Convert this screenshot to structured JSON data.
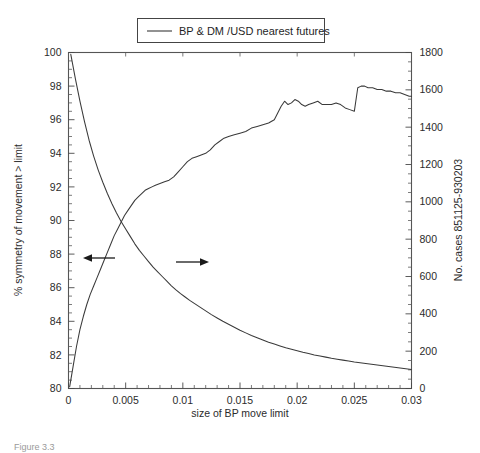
{
  "figure": {
    "caption_fragment": "Figure 3.3",
    "legend": {
      "label": "BP & DM /USD nearest futures",
      "swatch_name": "line-swatch"
    }
  },
  "chart_data": {
    "type": "line",
    "title": "",
    "subtitle": "",
    "xlabel": "size of BP move limit",
    "ylabel": "% symmetry of movement > limit",
    "y2label": "No. cases 851125-930203",
    "xlim": [
      0,
      0.03
    ],
    "ylim": [
      80,
      100
    ],
    "y2lim": [
      0,
      1800
    ],
    "grid": false,
    "legend_position": "top-center",
    "xticks": [
      0,
      0.005,
      0.01,
      0.015,
      0.02,
      0.025,
      0.03
    ],
    "xtick_labels": [
      "0",
      "0.005",
      "0.01",
      "0.015",
      "0.02",
      "0.025",
      "0.03"
    ],
    "yticks": [
      80,
      82,
      84,
      86,
      88,
      90,
      92,
      94,
      96,
      98,
      100
    ],
    "ytick_labels": [
      "80",
      "82",
      "84",
      "86",
      "88",
      "90",
      "92",
      "94",
      "96",
      "98",
      "100"
    ],
    "y2ticks": [
      0,
      200,
      400,
      600,
      800,
      1000,
      1200,
      1400,
      1600,
      1800
    ],
    "y2tick_labels": [
      "0",
      "200",
      "400",
      "600",
      "800",
      "1000",
      "1200",
      "1400",
      "1600",
      "1800"
    ],
    "annotations": [
      {
        "name": "left-arrow-to-left-axis",
        "text": "",
        "x": 0.0045,
        "y": 87.9,
        "direction": "left"
      },
      {
        "name": "right-arrow-to-right-axis",
        "text": "",
        "x": 0.0118,
        "y": 87.6,
        "direction": "right"
      }
    ],
    "series": [
      {
        "name": "% symmetry of movement > limit",
        "axis": "left",
        "unit": "percent",
        "x": [
          0.0001,
          0.0004,
          0.0007,
          0.001,
          0.0013,
          0.0016,
          0.0019,
          0.0022,
          0.0025,
          0.0028,
          0.0031,
          0.0034,
          0.0037,
          0.004,
          0.0043,
          0.0046,
          0.0049,
          0.0052,
          0.0055,
          0.0058,
          0.0061,
          0.0064,
          0.0067,
          0.007,
          0.0073,
          0.0076,
          0.008,
          0.0084,
          0.0088,
          0.0092,
          0.0096,
          0.01,
          0.0104,
          0.0108,
          0.0112,
          0.0116,
          0.012,
          0.0124,
          0.0128,
          0.0132,
          0.0136,
          0.014,
          0.0145,
          0.015,
          0.0155,
          0.016,
          0.0165,
          0.017,
          0.0175,
          0.018,
          0.0183,
          0.0186,
          0.0189,
          0.0192,
          0.0195,
          0.0198,
          0.0201,
          0.0204,
          0.0207,
          0.021,
          0.0214,
          0.0218,
          0.0222,
          0.0226,
          0.023,
          0.0234,
          0.0238,
          0.0242,
          0.0246,
          0.025,
          0.0253,
          0.0256,
          0.0259,
          0.0262,
          0.0266,
          0.027,
          0.0274,
          0.0278,
          0.0282,
          0.0286,
          0.029,
          0.0294,
          0.0298,
          0.03
        ],
        "y": [
          80.1,
          81.3,
          82.5,
          83.5,
          84.3,
          85.0,
          85.6,
          86.1,
          86.6,
          87.1,
          87.6,
          88.1,
          88.6,
          89.1,
          89.5,
          89.9,
          90.3,
          90.6,
          90.9,
          91.2,
          91.4,
          91.6,
          91.8,
          91.9,
          92.0,
          92.1,
          92.2,
          92.3,
          92.4,
          92.6,
          92.9,
          93.2,
          93.5,
          93.7,
          93.8,
          93.9,
          94.0,
          94.2,
          94.5,
          94.7,
          94.9,
          95.0,
          95.1,
          95.2,
          95.3,
          95.5,
          95.6,
          95.7,
          95.8,
          96.0,
          96.4,
          96.8,
          97.1,
          96.9,
          97.0,
          97.2,
          97.1,
          96.9,
          96.8,
          96.9,
          97.0,
          97.1,
          96.9,
          96.9,
          96.9,
          97.0,
          96.9,
          96.7,
          96.6,
          96.5,
          97.9,
          98.0,
          98.0,
          97.9,
          97.9,
          97.8,
          97.8,
          97.7,
          97.7,
          97.6,
          97.6,
          97.5,
          97.4,
          97.4
        ]
      },
      {
        "name": "No. cases 851125-930203",
        "axis": "right",
        "unit": "cases",
        "x": [
          0.0002,
          0.0006,
          0.001,
          0.0014,
          0.0018,
          0.0022,
          0.0026,
          0.003,
          0.0034,
          0.0038,
          0.0042,
          0.0046,
          0.005,
          0.0054,
          0.0058,
          0.0062,
          0.0066,
          0.007,
          0.0074,
          0.0078,
          0.0082,
          0.0086,
          0.009,
          0.0094,
          0.0098,
          0.0102,
          0.0106,
          0.011,
          0.0115,
          0.012,
          0.0125,
          0.013,
          0.0135,
          0.014,
          0.0145,
          0.015,
          0.0155,
          0.016,
          0.0165,
          0.017,
          0.0175,
          0.018,
          0.0185,
          0.019,
          0.0195,
          0.02,
          0.0205,
          0.021,
          0.0215,
          0.022,
          0.0225,
          0.023,
          0.0235,
          0.024,
          0.0245,
          0.025,
          0.0255,
          0.026,
          0.0265,
          0.027,
          0.0275,
          0.028,
          0.0285,
          0.029,
          0.0295,
          0.03
        ],
        "y": [
          1790,
          1660,
          1540,
          1430,
          1330,
          1245,
          1170,
          1105,
          1045,
          990,
          940,
          895,
          855,
          815,
          775,
          740,
          710,
          680,
          650,
          625,
          600,
          575,
          550,
          528,
          508,
          490,
          472,
          456,
          436,
          416,
          396,
          378,
          360,
          344,
          328,
          312,
          298,
          284,
          272,
          260,
          248,
          238,
          228,
          218,
          210,
          202,
          194,
          187,
          180,
          174,
          168,
          162,
          157,
          152,
          147,
          142,
          138,
          134,
          130,
          126,
          122,
          118,
          114,
          110,
          106,
          102
        ]
      }
    ]
  }
}
